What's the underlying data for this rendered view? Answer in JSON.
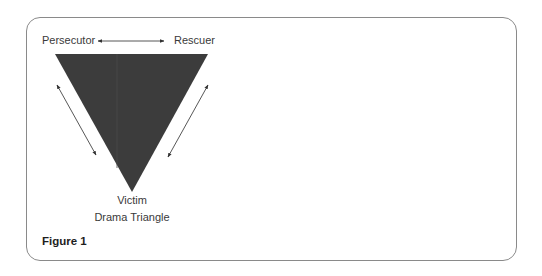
{
  "diagram": {
    "title": "Drama Triangle",
    "nodes": {
      "top_left": "Persecutor",
      "top_right": "Rescuer",
      "bottom": "Victim"
    },
    "caption": "Drama Triangle",
    "figure_label": "Figure 1",
    "edges": [
      {
        "from": "Persecutor",
        "to": "Rescuer",
        "type": "bidirectional-arrow"
      },
      {
        "from": "Persecutor",
        "to": "Victim",
        "type": "bidirectional-arrow"
      },
      {
        "from": "Rescuer",
        "to": "Victim",
        "type": "bidirectional-arrow"
      }
    ],
    "colors": {
      "triangle_fill": "#3c3c3c",
      "arrow": "#444444",
      "text": "#3a3a3a",
      "border": "#8a8a8a"
    }
  }
}
